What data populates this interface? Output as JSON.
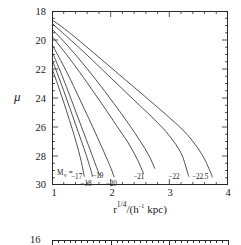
{
  "chart_data": {
    "type": "line",
    "title": "",
    "xlabel": "r^1/4 / (h^-1 kpc)",
    "xlabel_parts": {
      "base": "r",
      "exp": "1/4",
      "mid": "/(h",
      "exp2": "-1",
      "tail": " kpc)"
    },
    "ylabel": "μ",
    "xlim": [
      1,
      4
    ],
    "ylim_top": 18,
    "ylim_bottom": 30,
    "y_inverted": true,
    "grid": false,
    "legend_position": "inside-bottom",
    "xticks": [
      1,
      2,
      3,
      4
    ],
    "xtick_labels": [
      "1",
      "2",
      "3",
      "4"
    ],
    "yticks": [
      18,
      20,
      22,
      24,
      26,
      28,
      30
    ],
    "ytick_labels": [
      "18",
      "20",
      "22",
      "24",
      "26",
      "28",
      "30"
    ],
    "x_minor_step": 0.2,
    "y_minor_step": 0.5,
    "legend_prefix": "M",
    "legend_prefix_sub": "V",
    "legend_equals": "=",
    "series": [
      {
        "name": "-17",
        "label": "−17",
        "label_x": 1.46,
        "label_y": 29.45,
        "points": [
          [
            1.0,
            21.95
          ],
          [
            1.1,
            23.1
          ],
          [
            1.2,
            24.3
          ],
          [
            1.3,
            25.55
          ],
          [
            1.38,
            26.6
          ],
          [
            1.45,
            27.6
          ],
          [
            1.5,
            28.4
          ],
          [
            1.53,
            29.0
          ],
          [
            1.55,
            29.4
          ]
        ]
      },
      {
        "name": "-18",
        "label": "−18",
        "label_x": 1.62,
        "label_y": 29.9,
        "points": [
          [
            1.0,
            21.35
          ],
          [
            1.1,
            22.4
          ],
          [
            1.2,
            23.5
          ],
          [
            1.3,
            24.65
          ],
          [
            1.4,
            25.8
          ],
          [
            1.5,
            26.95
          ],
          [
            1.58,
            27.9
          ],
          [
            1.65,
            28.8
          ],
          [
            1.69,
            29.4
          ]
        ]
      },
      {
        "name": "-19",
        "label": "−19",
        "label_x": 1.82,
        "label_y": 29.4,
        "points": [
          [
            1.0,
            20.8
          ],
          [
            1.1,
            21.75
          ],
          [
            1.2,
            22.75
          ],
          [
            1.3,
            23.8
          ],
          [
            1.42,
            25.1
          ],
          [
            1.55,
            26.5
          ],
          [
            1.68,
            27.9
          ],
          [
            1.78,
            29.0
          ],
          [
            1.83,
            29.45
          ]
        ]
      },
      {
        "name": "-20",
        "label": "−20",
        "label_x": 2.05,
        "label_y": 29.95,
        "points": [
          [
            1.0,
            20.3
          ],
          [
            1.12,
            21.2
          ],
          [
            1.25,
            22.2
          ],
          [
            1.4,
            23.45
          ],
          [
            1.55,
            24.75
          ],
          [
            1.7,
            26.05
          ],
          [
            1.85,
            27.4
          ],
          [
            1.98,
            28.6
          ],
          [
            2.06,
            29.45
          ]
        ]
      },
      {
        "name": "-20.7",
        "label": "",
        "label_x": 0,
        "label_y": 0,
        "points": [
          [
            1.0,
            19.75
          ],
          [
            1.15,
            20.5
          ],
          [
            1.35,
            21.55
          ],
          [
            1.6,
            22.95
          ],
          [
            1.85,
            24.4
          ],
          [
            2.1,
            25.9
          ],
          [
            2.3,
            27.1
          ],
          [
            2.45,
            28.2
          ],
          [
            2.56,
            29.2
          ]
        ]
      },
      {
        "name": "-21",
        "label": "−21",
        "label_x": 2.52,
        "label_y": 29.45,
        "points": [
          [
            1.0,
            19.25
          ],
          [
            1.2,
            20.1
          ],
          [
            1.45,
            21.25
          ],
          [
            1.75,
            22.75
          ],
          [
            2.05,
            24.35
          ],
          [
            2.3,
            25.75
          ],
          [
            2.5,
            26.95
          ],
          [
            2.65,
            27.95
          ],
          [
            2.75,
            28.85
          ]
        ]
      },
      {
        "name": "-22",
        "label": "−22",
        "label_x": 3.12,
        "label_y": 29.45,
        "points": [
          [
            1.0,
            18.85
          ],
          [
            1.25,
            19.75
          ],
          [
            1.6,
            21.05
          ],
          [
            2.0,
            22.6
          ],
          [
            2.4,
            24.15
          ],
          [
            2.75,
            25.5
          ],
          [
            3.0,
            26.6
          ],
          [
            3.2,
            27.8
          ],
          [
            3.3,
            29.0
          ],
          [
            3.33,
            29.4
          ]
        ]
      },
      {
        "name": "-22.5",
        "label": "−22.5",
        "label_x": 3.52,
        "label_y": 29.45,
        "points": [
          [
            1.0,
            18.6
          ],
          [
            1.3,
            19.5
          ],
          [
            1.7,
            20.85
          ],
          [
            2.15,
            22.4
          ],
          [
            2.6,
            23.95
          ],
          [
            3.0,
            25.35
          ],
          [
            3.3,
            26.5
          ],
          [
            3.55,
            27.85
          ],
          [
            3.7,
            29.1
          ],
          [
            3.73,
            29.45
          ]
        ]
      }
    ]
  },
  "second_plot": {
    "ytick_label": "16",
    "xlim": [
      1,
      4
    ]
  }
}
